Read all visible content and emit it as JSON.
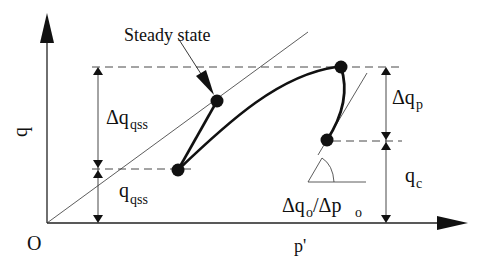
{
  "diagram": {
    "axes": {
      "y_label": "q",
      "x_label": "p'",
      "origin_label": "O"
    },
    "annotations": {
      "steady_state": "Steady state",
      "delta_q_qss": {
        "main": "Δq",
        "sub": "qss"
      },
      "q_qss": {
        "main": "q",
        "sub": "qss"
      },
      "delta_q_p": {
        "main": "Δq",
        "sub": "p"
      },
      "q_c": {
        "main": "q",
        "sub": "c"
      },
      "slope": {
        "a": "Δq",
        "a_sub": "o",
        "slash": "/Δp",
        "b_sub": "o"
      }
    },
    "points": [
      {
        "name": "steady-state-point",
        "x": 217,
        "y": 101
      },
      {
        "name": "initial-low-point",
        "x": 178,
        "y": 170
      },
      {
        "name": "peak-point",
        "x": 341,
        "y": 67
      },
      {
        "name": "right-low-point",
        "x": 327,
        "y": 140
      }
    ],
    "colors": {
      "ink": "#111111",
      "background": "#ffffff"
    }
  }
}
